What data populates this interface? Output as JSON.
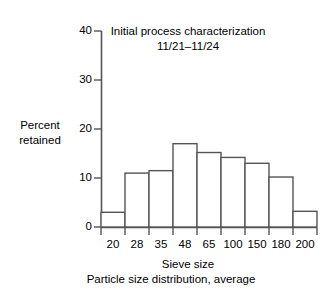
{
  "chart_data": {
    "type": "bar",
    "title": "Initial process characterization",
    "subtitle": "11/21–11/24",
    "xlabel": "Sieve size",
    "ylabel_line1": "Percent",
    "ylabel_line2": "retained",
    "caption": "Particle size distribution, average",
    "categories": [
      "20",
      "28",
      "35",
      "48",
      "65",
      "100",
      "150",
      "180",
      "200"
    ],
    "values": [
      3.0,
      11.0,
      11.5,
      17.0,
      15.2,
      14.2,
      13.0,
      10.2,
      3.2
    ],
    "xtick_labels": [
      "20",
      "28",
      "35",
      "48",
      "65",
      "100",
      "150",
      "180",
      "200"
    ],
    "ytick_labels": [
      "0",
      "10",
      "20",
      "30",
      "40"
    ],
    "ytick_values": [
      0,
      10,
      20,
      30,
      40
    ],
    "ylim": [
      0,
      40
    ],
    "grid": false,
    "legend": false,
    "line_color": "#555555",
    "text_color": "#000000",
    "bar_fill": "#ffffff"
  }
}
